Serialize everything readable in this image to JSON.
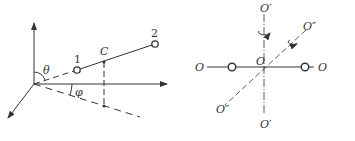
{
  "left_diagram": {
    "labels": {
      "atom1": "1",
      "atom2": "2",
      "center": "C",
      "theta": "θ",
      "phi": "φ"
    }
  },
  "right_diagram": {
    "labels": {
      "o_left": "O",
      "o_right": "O",
      "o_center": "O",
      "o_prime_top": "O′",
      "o_prime_bottom": "O′",
      "o_dprime_top": "O″",
      "o_dprime_bottom": "O″"
    }
  },
  "colors": {
    "line": "#333333",
    "background": "#ffffff"
  }
}
